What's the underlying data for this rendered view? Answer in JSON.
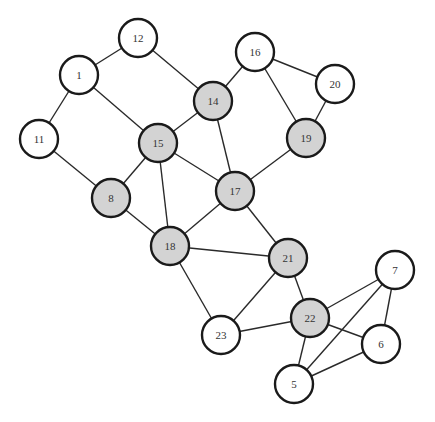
{
  "graph": {
    "colors": {
      "highlighted_fill": "#d3d3d3",
      "normal_fill": "#ffffff",
      "stroke": "#1a1a1a",
      "edge": "#2a2a2a"
    },
    "node_radius": 19,
    "nodes": [
      {
        "id": "1",
        "label": "1",
        "x": 79,
        "y": 75,
        "highlighted": false
      },
      {
        "id": "5",
        "label": "5",
        "x": 294,
        "y": 384,
        "highlighted": false
      },
      {
        "id": "6",
        "label": "6",
        "x": 381,
        "y": 344,
        "highlighted": false
      },
      {
        "id": "7",
        "label": "7",
        "x": 395,
        "y": 270,
        "highlighted": false
      },
      {
        "id": "8",
        "label": "8",
        "x": 111,
        "y": 198,
        "highlighted": true
      },
      {
        "id": "11",
        "label": "11",
        "x": 39,
        "y": 139,
        "highlighted": false
      },
      {
        "id": "12",
        "label": "12",
        "x": 138,
        "y": 38,
        "highlighted": false
      },
      {
        "id": "14",
        "label": "14",
        "x": 213,
        "y": 101,
        "highlighted": true
      },
      {
        "id": "15",
        "label": "15",
        "x": 158,
        "y": 143,
        "highlighted": true
      },
      {
        "id": "16",
        "label": "16",
        "x": 255,
        "y": 52,
        "highlighted": false
      },
      {
        "id": "17",
        "label": "17",
        "x": 235,
        "y": 191,
        "highlighted": true
      },
      {
        "id": "18",
        "label": "18",
        "x": 170,
        "y": 246,
        "highlighted": true
      },
      {
        "id": "19",
        "label": "19",
        "x": 306,
        "y": 138,
        "highlighted": true
      },
      {
        "id": "20",
        "label": "20",
        "x": 335,
        "y": 84,
        "highlighted": false
      },
      {
        "id": "21",
        "label": "21",
        "x": 288,
        "y": 258,
        "highlighted": true
      },
      {
        "id": "22",
        "label": "22",
        "x": 310,
        "y": 318,
        "highlighted": true
      },
      {
        "id": "23",
        "label": "23",
        "x": 221,
        "y": 335,
        "highlighted": false
      }
    ],
    "edges": [
      [
        "12",
        "1"
      ],
      [
        "12",
        "14"
      ],
      [
        "1",
        "11"
      ],
      [
        "1",
        "15"
      ],
      [
        "11",
        "8"
      ],
      [
        "14",
        "15"
      ],
      [
        "14",
        "16"
      ],
      [
        "14",
        "17"
      ],
      [
        "16",
        "20"
      ],
      [
        "16",
        "19"
      ],
      [
        "20",
        "19"
      ],
      [
        "19",
        "17"
      ],
      [
        "15",
        "8"
      ],
      [
        "15",
        "18"
      ],
      [
        "15",
        "17"
      ],
      [
        "8",
        "18"
      ],
      [
        "17",
        "18"
      ],
      [
        "17",
        "21"
      ],
      [
        "18",
        "21"
      ],
      [
        "18",
        "23"
      ],
      [
        "21",
        "23"
      ],
      [
        "21",
        "22"
      ],
      [
        "23",
        "22"
      ],
      [
        "22",
        "7"
      ],
      [
        "22",
        "6"
      ],
      [
        "22",
        "5"
      ],
      [
        "7",
        "6"
      ],
      [
        "7",
        "5"
      ],
      [
        "6",
        "5"
      ]
    ]
  }
}
